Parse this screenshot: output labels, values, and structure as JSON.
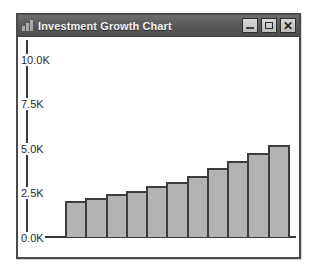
{
  "window": {
    "title": "Investment Growth Chart",
    "icon": "bar-chart-icon",
    "controls": {
      "minimize_label": "_",
      "maximize_label": "□",
      "close_label": "✕"
    }
  },
  "chart_data": {
    "type": "bar",
    "title": "Investment Growth Chart",
    "xlabel": "",
    "ylabel": "",
    "ylim": [
      0,
      11000
    ],
    "grid": false,
    "legend": null,
    "bar_color": "#b3b3b3",
    "bar_edge_color": "#3d3d3d",
    "ytick_labels": [
      "0.0K",
      "2.5K",
      "5.0K",
      "7.5K",
      "10.0K"
    ],
    "ytick_values": [
      0,
      2500,
      5000,
      7500,
      10000
    ],
    "xtick_labels": [],
    "categories": [
      "1",
      "2",
      "3",
      "4",
      "5",
      "6",
      "7",
      "8",
      "9",
      "10",
      "11"
    ],
    "values": [
      2000,
      2200,
      2400,
      2600,
      2850,
      3100,
      3450,
      3850,
      4250,
      4700,
      5150
    ]
  }
}
